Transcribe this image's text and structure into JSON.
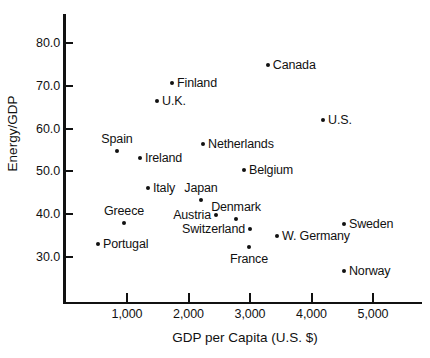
{
  "chart_data": {
    "type": "scatter",
    "title": "",
    "xlabel": "GDP per Capita (U.S. $)",
    "ylabel": "Energy/GDP",
    "xlim": [
      300,
      5840
    ],
    "ylim": [
      24.0,
      86.0
    ],
    "grid": false,
    "legend": "none",
    "xticks": [
      1000,
      2000,
      3000,
      4000,
      5000
    ],
    "xtick_labels": [
      "1,000",
      "2,000",
      "3,000",
      "4,000",
      "5,000"
    ],
    "yticks": [
      30.0,
      40.0,
      50.0,
      60.0,
      70.0,
      80.0
    ],
    "ytick_labels": [
      "30.0",
      "40.0",
      "50.0",
      "60.0",
      "70.0",
      "80.0"
    ],
    "points": [
      {
        "label": "Canada",
        "x": 3290,
        "y": 74.9,
        "label_pos": "right"
      },
      {
        "label": "Finland",
        "x": 1732,
        "y": 70.7,
        "label_pos": "right"
      },
      {
        "label": "U.K.",
        "x": 1488,
        "y": 66.5,
        "label_pos": "right"
      },
      {
        "label": "U.S.",
        "x": 4187,
        "y": 62.0,
        "label_pos": "right"
      },
      {
        "label": "Netherlands",
        "x": 2236,
        "y": 56.4,
        "label_pos": "right"
      },
      {
        "label": "Spain",
        "x": 837,
        "y": 54.7,
        "label_pos": "above"
      },
      {
        "label": "Ireland",
        "x": 1211,
        "y": 53.1,
        "label_pos": "right"
      },
      {
        "label": "Belgium",
        "x": 2902,
        "y": 50.3,
        "label_pos": "right"
      },
      {
        "label": "Italy",
        "x": 1341,
        "y": 46.1,
        "label_pos": "right"
      },
      {
        "label": "Japan",
        "x": 2203,
        "y": 43.3,
        "label_pos": "above"
      },
      {
        "label": "Austria",
        "x": 2447,
        "y": 39.8,
        "label_pos": "left"
      },
      {
        "label": "Denmark",
        "x": 2772,
        "y": 38.8,
        "label_pos": "above"
      },
      {
        "label": "Greece",
        "x": 951,
        "y": 37.9,
        "label_pos": "above"
      },
      {
        "label": "Sweden",
        "x": 4528,
        "y": 37.6,
        "label_pos": "right"
      },
      {
        "label": "Switzerland",
        "x": 3000,
        "y": 36.5,
        "label_pos": "left"
      },
      {
        "label": "W. Germany",
        "x": 3439,
        "y": 34.9,
        "label_pos": "right"
      },
      {
        "label": "Portugal",
        "x": 528,
        "y": 33.0,
        "label_pos": "right"
      },
      {
        "label": "France",
        "x": 2984,
        "y": 32.3,
        "label_pos": "below"
      },
      {
        "label": "Norway",
        "x": 4528,
        "y": 26.7,
        "label_pos": "right"
      }
    ]
  }
}
